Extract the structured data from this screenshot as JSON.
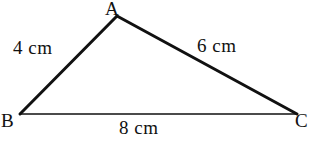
{
  "diagram": {
    "type": "triangle",
    "background_color": "#ffffff",
    "stroke_color": "#111111",
    "vertices": [
      {
        "name": "A",
        "label": "A",
        "x": 117,
        "y": 16
      },
      {
        "name": "B",
        "label": "B",
        "x": 20,
        "y": 114
      },
      {
        "name": "C",
        "label": "C",
        "x": 297,
        "y": 114
      }
    ],
    "sides": [
      {
        "name": "AB",
        "label": "4 cm",
        "value": 4,
        "unit": "cm",
        "from": "A",
        "to": "B",
        "stroke_width": 3
      },
      {
        "name": "AC",
        "label": "6 cm",
        "value": 6,
        "unit": "cm",
        "from": "A",
        "to": "C",
        "stroke_width": 3
      },
      {
        "name": "BC",
        "label": "8 cm",
        "value": 8,
        "unit": "cm",
        "from": "B",
        "to": "C",
        "stroke_width": 1.6
      }
    ]
  }
}
